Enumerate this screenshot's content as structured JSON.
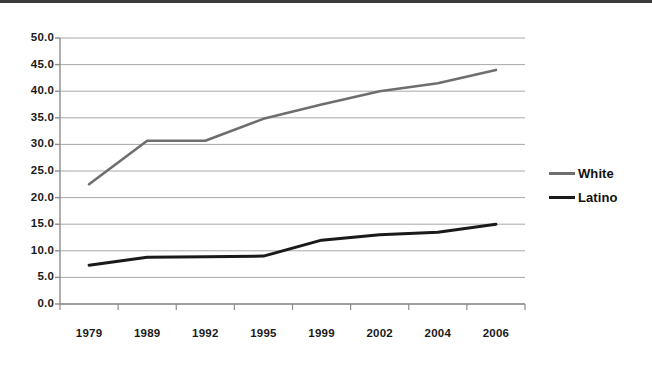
{
  "chart_data": {
    "type": "line",
    "title": "",
    "subtitle": "",
    "xlabel": "",
    "ylabel": "",
    "categories": [
      "1979",
      "1989",
      "1992",
      "1995",
      "1999",
      "2002",
      "2004",
      "2006"
    ],
    "series": [
      {
        "name": "White",
        "color": "#6e6e6e",
        "values": [
          22.5,
          30.7,
          30.7,
          34.8,
          37.5,
          40.0,
          41.5,
          44.0
        ]
      },
      {
        "name": "Latino",
        "color": "#1a1a1a",
        "values": [
          7.3,
          8.8,
          8.9,
          9.0,
          12.0,
          13.0,
          13.5,
          15.0
        ]
      }
    ],
    "ylim": [
      0.0,
      50.0
    ],
    "ytick_step": 5.0,
    "ytick_labels": [
      "0.0",
      "5.0",
      "10.0",
      "15.0",
      "20.0",
      "25.0",
      "30.0",
      "35.0",
      "40.0",
      "45.0",
      "50.0"
    ],
    "grid": true,
    "grid_axis": "y",
    "grid_color": "#a8a8a8",
    "axis_color": "#8c8c8c",
    "legend_position": "right",
    "background": "#ffffff",
    "border_top_color": "#3b3b3b"
  },
  "legend": {
    "items": [
      {
        "label": "White",
        "color": "#6e6e6e"
      },
      {
        "label": "Latino",
        "color": "#1a1a1a"
      }
    ]
  }
}
